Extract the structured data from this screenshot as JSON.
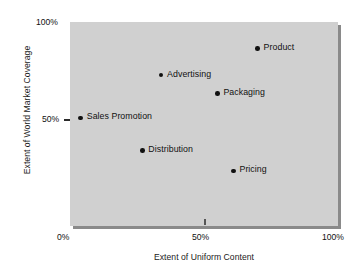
{
  "chart_data": {
    "type": "scatter",
    "title": "",
    "xlabel": "Extent of Uniform Content",
    "ylabel": "Extent of World Market Coverage",
    "xlim": [
      0,
      100
    ],
    "ylim": [
      0,
      100
    ],
    "x_ticks": [
      "0%",
      "50%",
      "100%"
    ],
    "x_tick_values": [
      0,
      50,
      100
    ],
    "y_ticks": [
      "50%",
      "100%"
    ],
    "y_tick_values": [
      50,
      100
    ],
    "grid": false,
    "legend": "none",
    "plot_background": "#d0d0d0",
    "point_color": "#111111",
    "points": [
      {
        "label": "Product",
        "x": 70,
        "y": 87
      },
      {
        "label": "Advertising",
        "x": 34,
        "y": 74
      },
      {
        "label": "Packaging",
        "x": 55,
        "y": 65
      },
      {
        "label": "Sales Promotion",
        "x": 4,
        "y": 53
      },
      {
        "label": "Distribution",
        "x": 27,
        "y": 37
      },
      {
        "label": "Pricing",
        "x": 61,
        "y": 27
      }
    ]
  }
}
